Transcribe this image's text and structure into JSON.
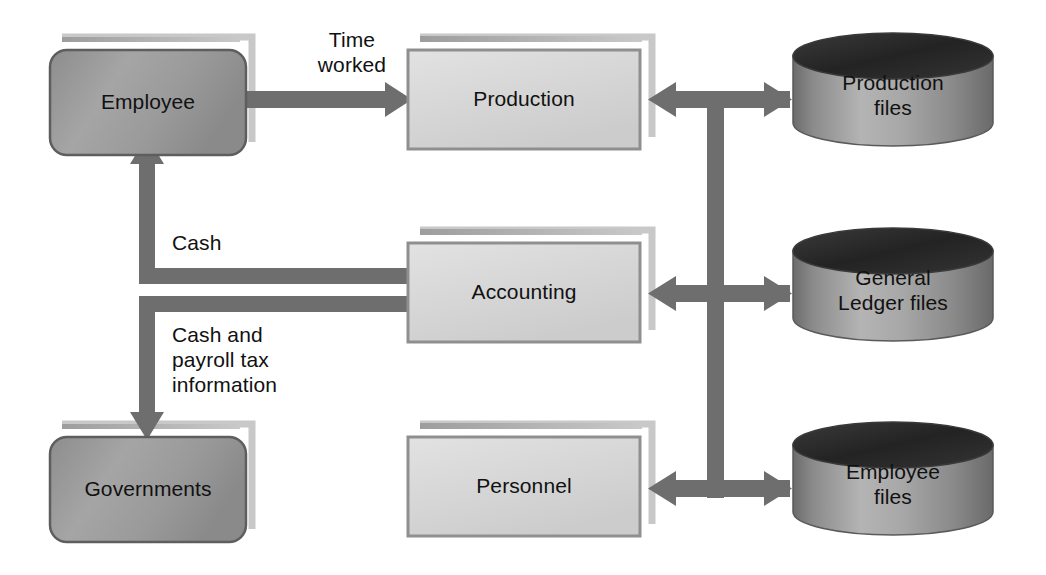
{
  "diagram": {
    "background": "#ffffff",
    "arrow_color": "#6e6e6e",
    "entity_fill": "#9b9b9b",
    "process_fill": "#d6d6d6",
    "datastore_top": "#2a2a2a",
    "text_color": "#111111"
  },
  "entities": [
    {
      "id": "employee",
      "label": "Employee",
      "shape": "rounded-rectangle",
      "type": "external-entity",
      "x": 50,
      "y": 50,
      "w": 196,
      "h": 105
    },
    {
      "id": "governments",
      "label": "Governments",
      "shape": "rounded-rectangle",
      "type": "external-entity",
      "x": 50,
      "y": 437,
      "w": 196,
      "h": 105
    }
  ],
  "processes": [
    {
      "id": "production",
      "label": "Production",
      "shape": "rectangle",
      "type": "department",
      "x": 408,
      "y": 50,
      "w": 232,
      "h": 99
    },
    {
      "id": "accounting",
      "label": "Accounting",
      "shape": "rectangle",
      "type": "department",
      "x": 408,
      "y": 243,
      "w": 232,
      "h": 99
    },
    {
      "id": "personnel",
      "label": "Personnel",
      "shape": "rectangle",
      "type": "department",
      "x": 408,
      "y": 437,
      "w": 232,
      "h": 99
    }
  ],
  "datastores": [
    {
      "id": "production-files",
      "label": "Production\nfiles",
      "shape": "cylinder",
      "x": 793,
      "y": 33,
      "w": 200,
      "h": 113
    },
    {
      "id": "general-ledger-files",
      "label": "General\nLedger files",
      "shape": "cylinder",
      "x": 793,
      "y": 228,
      "w": 200,
      "h": 113
    },
    {
      "id": "employee-files",
      "label": "Employee\nfiles",
      "shape": "cylinder",
      "x": 793,
      "y": 422,
      "w": 200,
      "h": 113
    }
  ],
  "flows": [
    {
      "id": "time-worked",
      "label": "Time\nworked",
      "from": "employee",
      "to": "production",
      "direction": "one-way",
      "label_x": 292,
      "label_y": 27
    },
    {
      "id": "cash",
      "label": "Cash",
      "from": "accounting",
      "to": "employee",
      "direction": "one-way",
      "label_x": 172,
      "label_y": 230
    },
    {
      "id": "cash-and-payroll-tax-information",
      "label": "Cash and\npayroll tax\ninformation",
      "from": "accounting",
      "to": "governments",
      "direction": "one-way",
      "label_x": 172,
      "label_y": 322
    },
    {
      "id": "production-to-files",
      "label": "",
      "from": "production",
      "to": "production-files",
      "direction": "two-way"
    },
    {
      "id": "accounting-to-ledger",
      "label": "",
      "from": "accounting",
      "to": "general-ledger-files",
      "direction": "two-way"
    },
    {
      "id": "personnel-to-employee-files",
      "label": "",
      "from": "personnel",
      "to": "employee-files",
      "direction": "two-way"
    }
  ]
}
